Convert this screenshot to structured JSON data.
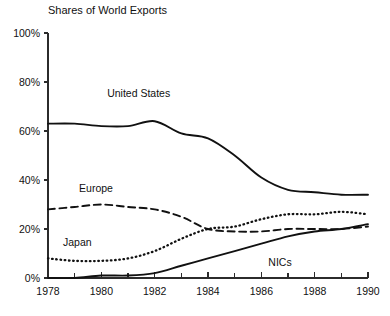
{
  "chart_data": {
    "type": "line",
    "title": "Shares of World Exports",
    "xlabel": "",
    "ylabel": "",
    "xlim": [
      1978,
      1990
    ],
    "ylim": [
      0,
      100
    ],
    "grid": false,
    "legend_position": "inline-annotations",
    "x": [
      1978,
      1979,
      1980,
      1981,
      1982,
      1983,
      1984,
      1985,
      1986,
      1987,
      1988,
      1989,
      1990
    ],
    "x_tick_labels": [
      "1978",
      "1980",
      "1982",
      "1984",
      "1986",
      "1988",
      "1990"
    ],
    "x_tick_values": [
      1978,
      1980,
      1982,
      1984,
      1986,
      1988,
      1990
    ],
    "x_minor_ticks": [
      1979,
      1981,
      1983,
      1985,
      1987,
      1989
    ],
    "y_tick_labels": [
      "0%",
      "20%",
      "40%",
      "60%",
      "80%",
      "100%"
    ],
    "y_tick_values": [
      0,
      20,
      40,
      60,
      80,
      100
    ],
    "series": [
      {
        "name": "United States",
        "style": "solid",
        "label": "United States",
        "values": [
          63,
          63,
          62,
          62,
          64,
          59,
          57,
          50,
          41,
          36,
          35,
          34,
          34
        ]
      },
      {
        "name": "Europe",
        "style": "dashed",
        "label": "Europe",
        "values": [
          28,
          29,
          30,
          29,
          28,
          25,
          20,
          19,
          19,
          20,
          20,
          20,
          21
        ]
      },
      {
        "name": "Japan",
        "style": "dotted",
        "label": "Japan",
        "values": [
          8,
          7,
          7,
          8,
          11,
          16,
          20,
          21,
          24,
          26,
          26,
          27,
          26
        ]
      },
      {
        "name": "NICs",
        "style": "solid",
        "label": "NICs",
        "values": [
          0,
          0,
          1,
          1,
          2,
          5,
          8,
          11,
          14,
          17,
          19,
          20,
          22
        ]
      }
    ],
    "annotations": [
      {
        "text": "United States",
        "x": 1981.4,
        "y": 74
      },
      {
        "text": "Europe",
        "x": 1979.8,
        "y": 35
      },
      {
        "text": "Japan",
        "x": 1979.1,
        "y": 13
      },
      {
        "text": "NICs",
        "x": 1986.7,
        "y": 5
      }
    ]
  },
  "axis": {
    "y_labels": [
      "100%",
      "80%",
      "60%",
      "40%",
      "20%",
      "0%"
    ],
    "x_labels": [
      "1978",
      "1980",
      "1982",
      "1984",
      "1986",
      "1988",
      "1990"
    ]
  }
}
